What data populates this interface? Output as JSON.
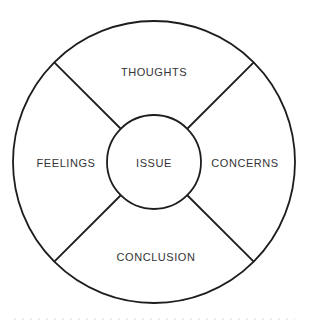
{
  "diagram": {
    "background_color": "#ffffff",
    "stroke_color": "#1d1d1f",
    "text_color": "#333335",
    "geometry": {
      "canvas_width": 309,
      "canvas_height": 324,
      "center_x": 154,
      "center_y": 162,
      "outer_radius": 141,
      "inner_radius": 47,
      "spoke_angles_deg": [
        45,
        135,
        225,
        315
      ]
    },
    "hub": {
      "label": "ISSUE",
      "center_x": 154,
      "center_y": 162
    },
    "segments": [
      {
        "id": "thoughts",
        "label": "THOUGHTS",
        "position": "top",
        "label_x": 154,
        "label_y": 72
      },
      {
        "id": "concerns",
        "label": "CONCERNS",
        "position": "right",
        "label_x": 245,
        "label_y": 163
      },
      {
        "id": "conclusion",
        "label": "CONCLUSION",
        "position": "bottom",
        "label_x": 156,
        "label_y": 257
      },
      {
        "id": "feelings",
        "label": "FEELINGS",
        "position": "left",
        "label_x": 66,
        "label_y": 163
      }
    ]
  }
}
